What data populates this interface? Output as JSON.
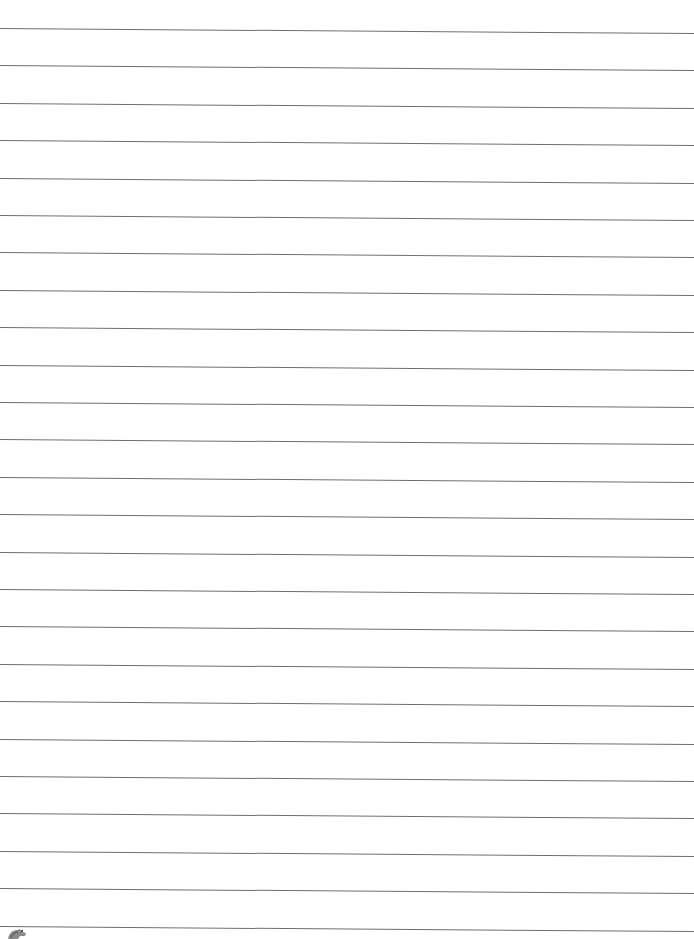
{
  "document": {
    "type": "lined-paper",
    "line_count": 25,
    "first_line_y": 28,
    "line_spacing": 37.4,
    "line_slope_deg": 0.42,
    "line_color": "#6e6e6e",
    "background_color": "#ffffff",
    "footer_logo": {
      "icon": "printer-logo-icon"
    }
  }
}
